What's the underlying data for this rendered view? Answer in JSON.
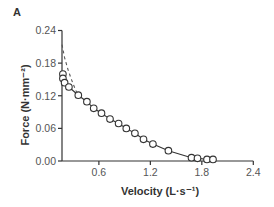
{
  "panel_label": "A",
  "chart_data": {
    "type": "line",
    "title": "",
    "xlabel": "Velocity (L·s⁻¹)",
    "ylabel": "Force (N·mm⁻²)",
    "xlim": [
      0.17,
      2.4
    ],
    "ylim": [
      0.0,
      0.24
    ],
    "xticks": [
      0.6,
      1.2,
      1.8,
      2.4
    ],
    "xtick_labels": [
      "0.6",
      "1.2",
      "1.8",
      "2.4"
    ],
    "yticks": [
      0.0,
      0.06,
      0.12,
      0.18,
      0.24
    ],
    "ytick_labels": [
      "0.00",
      "0.06",
      "0.12",
      "0.18",
      "0.24"
    ],
    "grid": false,
    "legend": null,
    "series": [
      {
        "name": "measured",
        "style": "solid line with open circle markers",
        "color": "#333333",
        "x": [
          0.18,
          0.18,
          0.2,
          0.25,
          0.36,
          0.46,
          0.54,
          0.63,
          0.73,
          0.83,
          0.92,
          1.02,
          1.12,
          1.23,
          1.41,
          1.68,
          1.75,
          1.86,
          1.93
        ],
        "y": [
          0.16,
          0.152,
          0.144,
          0.136,
          0.121,
          0.109,
          0.097,
          0.088,
          0.077,
          0.069,
          0.06,
          0.051,
          0.04,
          0.031,
          0.019,
          0.006,
          0.005,
          0.003,
          0.003
        ]
      },
      {
        "name": "fit",
        "style": "dashed line",
        "color": "#555555",
        "x": [
          0.17,
          0.2,
          0.24,
          0.28,
          0.33,
          0.36
        ],
        "y": [
          0.214,
          0.19,
          0.168,
          0.15,
          0.13,
          0.121
        ]
      }
    ]
  }
}
